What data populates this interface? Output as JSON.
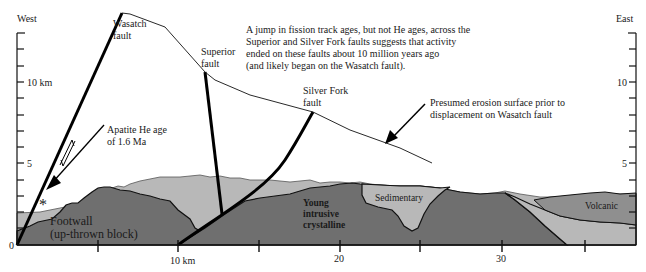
{
  "figure": {
    "type": "geologic-cross-section",
    "direction_labels": {
      "west": "West",
      "east": "East"
    },
    "left_axis": {
      "label_10": "10 km",
      "label_5": "5",
      "label_0": "0"
    },
    "right_axis": {
      "label_10": "10",
      "label_5": "5"
    },
    "bottom_axis": {
      "label_10": "10 km",
      "label_20": "20",
      "label_30": "30"
    },
    "faults": {
      "wasatch": {
        "line1": "Wasatch",
        "line2": "fault"
      },
      "superior": {
        "line1": "Superior",
        "line2": "fault"
      },
      "silver_fork": {
        "line1": "Silver Fork",
        "line2": "fault"
      }
    },
    "annotations": {
      "main_note": [
        "A jump in fission track ages, but not He ages, across the",
        "Superior and Silver Fork faults suggests that activity",
        "ended on these faults about 10 million years ago",
        "(and likely began on the Wasatch fault)."
      ],
      "erosion_note": [
        "Presumed erosion surface prior to",
        "displacement on Wasatch fault"
      ],
      "apatite_note": [
        "Apatite He age",
        "of 1.6 Ma"
      ],
      "sample_marker": "*"
    },
    "units": {
      "footwall": {
        "line1": "Footwall",
        "line2": "(up-thrown block)"
      },
      "young_intrusive": {
        "line1": "Young",
        "line2": "intrusive",
        "line3": "crystalline"
      },
      "sedimentary": "Sedimentary",
      "volcanic": "Volcanic"
    },
    "colors": {
      "dark_rock": "#6e6e6e",
      "medium_rock": "#8f8f8f",
      "light_rock": "#b4b4b4",
      "lighter_fill": "#c8c8c8",
      "line": "#111111"
    }
  }
}
